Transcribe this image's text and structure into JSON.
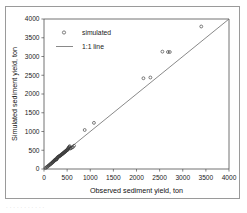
{
  "chart_data": {
    "type": "scatter",
    "title": "",
    "xlabel": "Observed sediment yield, ton",
    "ylabel": "Simulated sediment yield, ton",
    "xlim": [
      0,
      4000
    ],
    "ylim": [
      0,
      4000
    ],
    "xticks": [
      0,
      500,
      1000,
      1500,
      2000,
      2500,
      3000,
      3500,
      4000
    ],
    "yticks": [
      0,
      500,
      1000,
      1500,
      2000,
      2500,
      3000,
      3500,
      4000
    ],
    "xtick_labels": [
      "0",
      "500",
      "1000",
      "1500",
      "2000",
      "2500",
      "3000",
      "3500",
      "4000"
    ],
    "ytick_labels": [
      "0",
      "500",
      "1000",
      "1500",
      "2000",
      "2500",
      "3000",
      "3500",
      "4000"
    ],
    "grid": false,
    "legend_position": "upper-left-inside",
    "legend": [
      {
        "label": "simulated",
        "kind": "marker",
        "marker": "open-circle",
        "color": "#3a3a3a"
      },
      {
        "label": "1:1 line",
        "kind": "line",
        "color": "#6b6b6b"
      }
    ],
    "series": [
      {
        "name": "simulated",
        "marker": "open-circle",
        "color": "#3a3a3a",
        "points": [
          [
            30,
            25
          ],
          [
            55,
            45
          ],
          [
            70,
            60
          ],
          [
            90,
            80
          ],
          [
            105,
            95
          ],
          [
            120,
            110
          ],
          [
            135,
            125
          ],
          [
            150,
            140
          ],
          [
            160,
            150
          ],
          [
            175,
            165
          ],
          [
            185,
            180
          ],
          [
            195,
            190
          ],
          [
            205,
            200
          ],
          [
            215,
            215
          ],
          [
            225,
            225
          ],
          [
            235,
            240
          ],
          [
            245,
            250
          ],
          [
            255,
            262
          ],
          [
            262,
            250
          ],
          [
            270,
            258
          ],
          [
            278,
            268
          ],
          [
            285,
            300
          ],
          [
            295,
            310
          ],
          [
            305,
            320
          ],
          [
            315,
            330
          ],
          [
            325,
            335
          ],
          [
            335,
            345
          ],
          [
            345,
            352
          ],
          [
            355,
            360
          ],
          [
            365,
            372
          ],
          [
            375,
            380
          ],
          [
            385,
            392
          ],
          [
            395,
            400
          ],
          [
            405,
            410
          ],
          [
            415,
            420
          ],
          [
            425,
            430
          ],
          [
            435,
            442
          ],
          [
            445,
            450
          ],
          [
            455,
            462
          ],
          [
            465,
            470
          ],
          [
            475,
            482
          ],
          [
            485,
            495
          ],
          [
            495,
            500
          ],
          [
            505,
            512
          ],
          [
            515,
            520
          ],
          [
            520,
            545
          ],
          [
            530,
            560
          ],
          [
            540,
            575
          ],
          [
            548,
            590
          ],
          [
            556,
            610
          ],
          [
            565,
            545
          ],
          [
            580,
            555
          ],
          [
            600,
            570
          ],
          [
            625,
            585
          ],
          [
            650,
            620
          ],
          [
            880,
            1040
          ],
          [
            1080,
            1230
          ],
          [
            2150,
            2420
          ],
          [
            2300,
            2440
          ],
          [
            2560,
            3130
          ],
          [
            2680,
            3120
          ],
          [
            2720,
            3120
          ],
          [
            3400,
            3800
          ]
        ]
      }
    ],
    "reference_line": {
      "name": "1:1 line",
      "from": [
        0,
        0
      ],
      "to": [
        4000,
        4000
      ],
      "color": "#6b6b6b"
    }
  },
  "caption_fragment": "·  ·   ·    ·     ·      ·       ·        ·         ·          ·           ·"
}
